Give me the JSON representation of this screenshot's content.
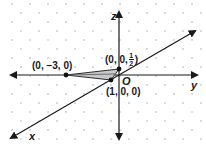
{
  "diagram": {
    "type": "3d-coordinate-axes",
    "axes": {
      "x_label": "x",
      "y_label": "y",
      "z_label": "z",
      "origin_label": "O"
    },
    "points": [
      {
        "label_parts": [
          "(0, ",
          "−3, ",
          "0)"
        ],
        "label": "(0, −3, 0)"
      },
      {
        "label": "(0, 0, 1/2)",
        "prefix": "(0, 0, ",
        "num": "1",
        "den": "2",
        "suffix": ")"
      },
      {
        "label": "(1, 0, 0)"
      }
    ],
    "colors": {
      "axis": "#1a1a1a",
      "dot_grid": "#9a9a9a",
      "triangle_fill": "#c8c8c8",
      "triangle_stroke": "#2a2a2a"
    }
  }
}
